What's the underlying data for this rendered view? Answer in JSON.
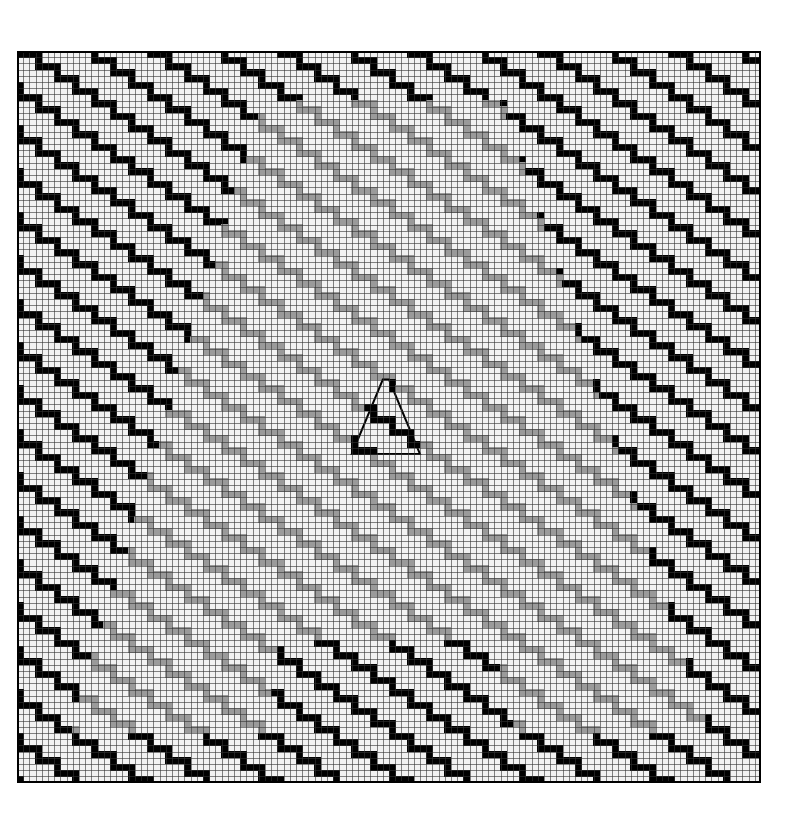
{
  "figure": {
    "title": "Staircase zigzag grid pattern with gray trapezoid and central triangle",
    "background": "#ffffff"
  },
  "grid": {
    "origin_x": 17,
    "origin_y": 51,
    "cell_size": 6.2,
    "cols": 120,
    "rows": 118,
    "grid_line_color": "#333333",
    "cell_fill_color": "#f2f2f2",
    "border_color": "#000000"
  },
  "pattern": {
    "type": "staircase",
    "tread_cells": 3,
    "riser_cells": 2,
    "period_rows": 7,
    "band_thickness": 1
  },
  "colors": {
    "outer_stripe": "#000000",
    "inner_stripe": "#9a9a9a",
    "triangle_stripe": "#000000"
  },
  "regions": {
    "gray_trapezoid": {
      "top_row": 8,
      "bottom_row": 110,
      "top_left_col": 40,
      "top_right_col": 78,
      "bottom_left_col": 9,
      "bottom_right_col": 111
    },
    "bottom_black_trapezoid": {
      "top_row": 95,
      "bottom_row": 110,
      "top_left_col": 43,
      "top_right_col": 76,
      "bottom_left_col": 40,
      "bottom_right_col": 80
    },
    "center_triangle": {
      "apex_row": 53,
      "base_row": 65,
      "apex_col": 59.5,
      "base_left_col": 54,
      "base_right_col": 65
    }
  }
}
